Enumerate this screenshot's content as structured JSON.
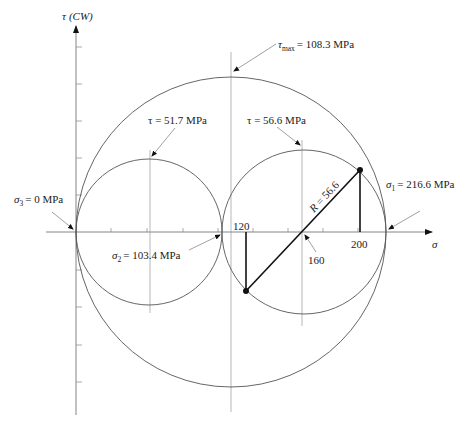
{
  "diagram": {
    "type": "mohr-circle",
    "axes": {
      "x_label": "σ",
      "y_label": "τ (CW)",
      "y_label_symbol": "τ",
      "y_label_suffix": "(CW)"
    },
    "labels": {
      "tau_max": {
        "symbol": "τ",
        "subscript": "max",
        "value": "= 108.3 MPa"
      },
      "tau_left": {
        "text": "τ = 51.7 MPa"
      },
      "tau_right": {
        "text": "τ = 56.6 MPa"
      },
      "sigma3": {
        "symbol": "σ",
        "subscript": "3",
        "value": "= 0 MPa"
      },
      "sigma1": {
        "symbol": "σ",
        "subscript": "1",
        "value": "= 216.6 MPa"
      },
      "sigma2": {
        "symbol": "σ",
        "subscript": "2",
        "value": "= 103.4 MPa"
      },
      "radius": {
        "symbol": "R",
        "value": " = 56.6"
      },
      "tick_120": "120",
      "tick_160": "160",
      "tick_200": "200"
    },
    "principal_stresses_mpa": {
      "sigma1": 216.6,
      "sigma2": 103.4,
      "sigma3": 0
    },
    "circles": [
      {
        "name": "outer",
        "center_sigma": 108.3,
        "radius": 108.3
      },
      {
        "name": "left",
        "center_sigma": 51.7,
        "radius": 51.7
      },
      {
        "name": "right",
        "center_sigma": 160,
        "radius": 56.6
      }
    ],
    "stress_points": [
      {
        "sigma": 120,
        "tau": -40
      },
      {
        "sigma": 200,
        "tau": 40
      }
    ],
    "colors": {
      "line": "#555555",
      "thick": "#111111",
      "text": "#222222"
    }
  }
}
